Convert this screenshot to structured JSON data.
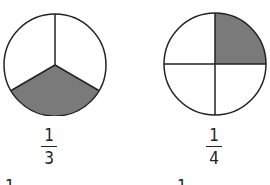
{
  "figures": [
    {
      "label": {
        "numerator": "1",
        "denominator": "3"
      },
      "parts": 3,
      "shaded_parts": 1,
      "shaded_region": "bottom"
    },
    {
      "label": {
        "numerator": "1",
        "denominator": "4"
      },
      "parts": 4,
      "shaded_parts": 1,
      "shaded_region": "top-right"
    }
  ],
  "clipped_next_row": [
    "1",
    "1"
  ],
  "colors": {
    "shade": "#7a7a7a",
    "stroke": "#222222",
    "background": "#ffffff"
  }
}
